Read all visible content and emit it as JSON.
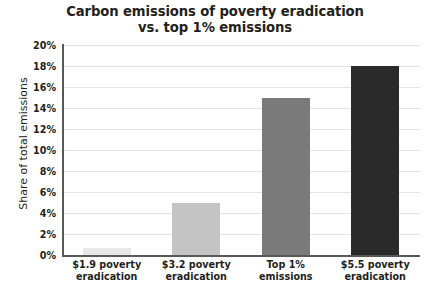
{
  "chart_data": {
    "type": "bar",
    "title": "Carbon emissions of poverty eradication\nvs. top 1% emissions",
    "xlabel": "",
    "ylabel": "Share of total emissions",
    "categories": [
      "$1.9 poverty\neradication",
      "$3.2 poverty\neradication",
      "Top 1%\nemissions",
      "$5.5 poverty\neradication"
    ],
    "values": [
      0.7,
      5.0,
      15.0,
      18.0
    ],
    "value_labels": [
      "0.7%",
      "5%",
      "15%",
      "18%"
    ],
    "bar_colors": [
      "#e8e8e8",
      "#c4c4c4",
      "#7a7a7a",
      "#2a2a2a"
    ],
    "ylim": [
      0,
      20
    ],
    "ytick_values": [
      0,
      2,
      4,
      6,
      8,
      10,
      12,
      14,
      16,
      18,
      20
    ],
    "ytick_labels": [
      "0%",
      "2%",
      "4%",
      "6%",
      "8%",
      "10%",
      "12%",
      "14%",
      "16%",
      "18%",
      "20%"
    ],
    "grid": true,
    "legend": "none",
    "axis_color": "#58595b",
    "gridline_color": "#e3e3e3",
    "background": "#ffffff"
  }
}
